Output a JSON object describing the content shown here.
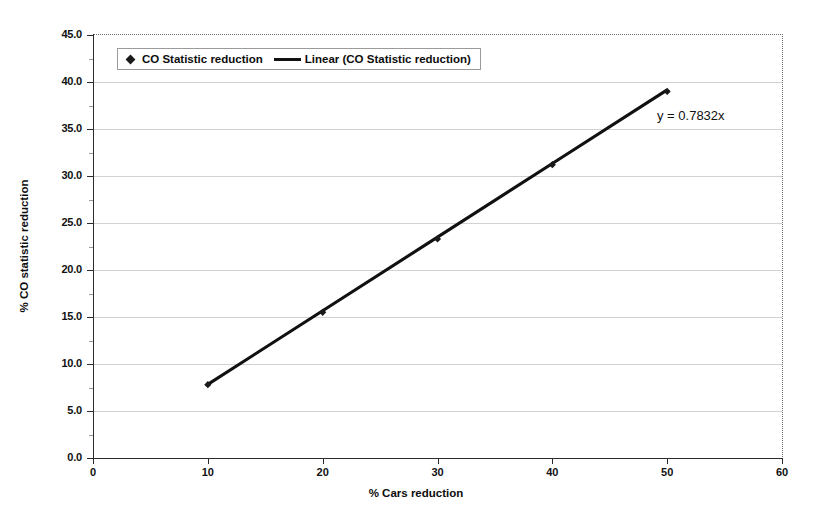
{
  "chart_data": {
    "type": "scatter",
    "title": "",
    "xlabel": "% Cars reduction",
    "ylabel": "% CO statistic reduction",
    "xlim": [
      0,
      60
    ],
    "ylim": [
      0.0,
      45.0
    ],
    "xticks": [
      "0",
      "10",
      "20",
      "30",
      "40",
      "50",
      "60"
    ],
    "xtick_values": [
      0,
      10,
      20,
      30,
      40,
      50,
      60
    ],
    "yticks": [
      "0.0",
      "5.0",
      "10.0",
      "15.0",
      "20.0",
      "25.0",
      "30.0",
      "35.0",
      "40.0",
      "45.0"
    ],
    "ytick_values": [
      0,
      5,
      10,
      15,
      20,
      25,
      30,
      35,
      40,
      45
    ],
    "grid": "horizontal",
    "legend_position": "top-left-inside",
    "x": [
      10,
      20,
      30,
      40,
      50
    ],
    "series": [
      {
        "name": "CO Statistic reduction",
        "type": "scatter",
        "marker": "diamond",
        "color": "#1a1a1a",
        "values": [
          7.8,
          15.5,
          23.3,
          31.2,
          39.0
        ]
      },
      {
        "name": "Linear (CO Statistic reduction)",
        "type": "line",
        "color": "#111111",
        "values": [
          7.832,
          15.664,
          23.496,
          31.328,
          39.16
        ]
      }
    ],
    "annotations": [
      {
        "name": "trendline-equation",
        "text": "y = 0.7832x",
        "x": 51,
        "y": 35.5
      }
    ],
    "trendline": {
      "equation": "y = 0.7832x",
      "slope": 0.7832,
      "intercept": 0
    }
  },
  "legend": {
    "items": [
      {
        "label": "CO Statistic reduction",
        "marker": "diamond"
      },
      {
        "label": "Linear (CO Statistic reduction)",
        "marker": "line"
      }
    ]
  },
  "axes": {
    "x_title": "% Cars reduction",
    "y_title": "% CO statistic reduction"
  },
  "colors": {
    "series": "#1a1a1a",
    "trendline": "#111111",
    "gridline": "#d2d2d2",
    "axis": "#2b2b2b",
    "background": "#ffffff"
  }
}
